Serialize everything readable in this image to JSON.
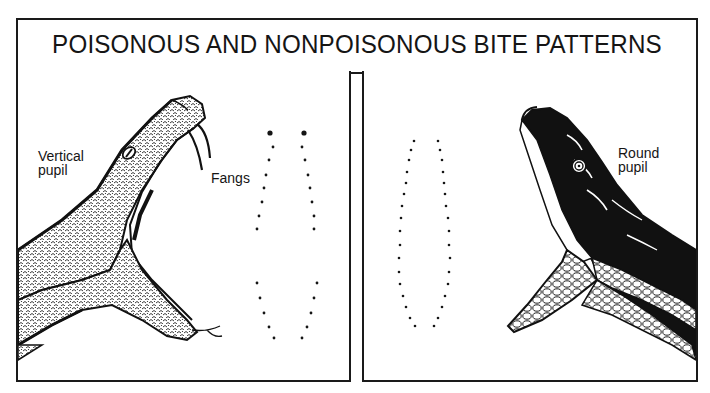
{
  "title": "POISONOUS AND NONPOISONOUS BITE PATTERNS",
  "panels": {
    "left": {
      "kind": "poisonous",
      "labels": {
        "eye": [
          "Vertical",
          "pupil"
        ],
        "fangs": "Fangs"
      },
      "bite_pattern": {
        "description": "Two fang punctures above two rows of small tooth marks",
        "fang_marks": [
          [
            268,
            133
          ],
          [
            302,
            133
          ]
        ],
        "upper_left_row": [
          [
            271,
            147
          ],
          [
            267,
            160
          ],
          [
            264,
            175
          ],
          [
            262,
            188
          ],
          [
            260,
            202
          ],
          [
            257,
            216
          ],
          [
            255,
            229
          ]
        ],
        "upper_right_row": [
          [
            300,
            147
          ],
          [
            303,
            160
          ],
          [
            306,
            175
          ],
          [
            308,
            188
          ],
          [
            310,
            202
          ],
          [
            312,
            216
          ],
          [
            312,
            229
          ]
        ],
        "lower_left_row": [
          [
            255,
            283
          ],
          [
            258,
            298
          ],
          [
            262,
            313
          ],
          [
            267,
            327
          ],
          [
            272,
            338
          ]
        ],
        "lower_right_row": [
          [
            315,
            283
          ],
          [
            312,
            298
          ],
          [
            309,
            313
          ],
          [
            305,
            327
          ],
          [
            300,
            338
          ]
        ]
      }
    },
    "right": {
      "kind": "nonpoisonous",
      "labels": {
        "eye": [
          "Round",
          "pupil"
        ]
      },
      "bite_pattern": {
        "description": "U-shaped oval of small tooth marks, no fang punctures",
        "left_row": [
          [
            412,
            141
          ],
          [
            409,
            150
          ],
          [
            407,
            160
          ],
          [
            405,
            172
          ],
          [
            404,
            183
          ],
          [
            402,
            194
          ],
          [
            400,
            206
          ],
          [
            399,
            218
          ],
          [
            398,
            231
          ],
          [
            398,
            245
          ],
          [
            397,
            258
          ],
          [
            397,
            272
          ],
          [
            398,
            284
          ],
          [
            401,
            296
          ],
          [
            404,
            307
          ],
          [
            408,
            318
          ],
          [
            413,
            326
          ]
        ],
        "right_row": [
          [
            436,
            141
          ],
          [
            438,
            150
          ],
          [
            440,
            160
          ],
          [
            441,
            172
          ],
          [
            442,
            183
          ],
          [
            443,
            194
          ],
          [
            444,
            206
          ],
          [
            446,
            218
          ],
          [
            447,
            231
          ],
          [
            447,
            245
          ],
          [
            448,
            258
          ],
          [
            447,
            272
          ],
          [
            446,
            284
          ],
          [
            443,
            296
          ],
          [
            440,
            307
          ],
          [
            436,
            318
          ],
          [
            432,
            326
          ]
        ]
      }
    }
  },
  "colors": {
    "ink": "#151515",
    "paper": "#ffffff"
  }
}
